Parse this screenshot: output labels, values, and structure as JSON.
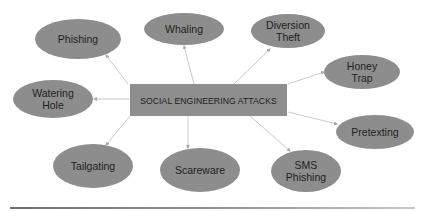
{
  "diagram": {
    "title": "SOCIAL ENGINEERING ATTACKS",
    "center": {
      "label": "SOCIAL ENGINEERING ATTACKS",
      "x": 130,
      "y": 84,
      "width": 157,
      "height": 32
    },
    "colors": {
      "node_fill": "#8d8d8d",
      "center_fill": "#8e8e8e",
      "text": "#1e1e1e",
      "connector": "#c4c4c4",
      "background": "#ffffff"
    },
    "nodes": [
      {
        "id": "phishing",
        "lines": [
          "Phishing"
        ],
        "cx": 78,
        "cy": 39,
        "rx": 43,
        "ry": 20,
        "from": [
          128,
          84
        ],
        "to": [
          106,
          55
        ]
      },
      {
        "id": "whaling",
        "lines": [
          "Whaling"
        ],
        "cx": 184,
        "cy": 29,
        "rx": 40,
        "ry": 16,
        "from": [
          194,
          84
        ],
        "to": [
          184,
          46
        ]
      },
      {
        "id": "diversion-theft",
        "lines": [
          "Diversion",
          "Theft"
        ],
        "cx": 288,
        "cy": 31,
        "rx": 37,
        "ry": 17,
        "from": [
          234,
          84
        ],
        "to": [
          270,
          49
        ]
      },
      {
        "id": "honey-trap",
        "lines": [
          "Honey",
          "Trap"
        ],
        "cx": 362,
        "cy": 72,
        "rx": 38,
        "ry": 17,
        "from": [
          288,
          84
        ],
        "to": [
          324,
          72
        ]
      },
      {
        "id": "watering-hole",
        "lines": [
          "Watering",
          "Hole"
        ],
        "cx": 53,
        "cy": 99,
        "rx": 40,
        "ry": 19,
        "from": [
          130,
          99
        ],
        "to": [
          94,
          99
        ]
      },
      {
        "id": "pretexting",
        "lines": [
          "Pretexting"
        ],
        "cx": 375,
        "cy": 132,
        "rx": 39,
        "ry": 17,
        "from": [
          288,
          112
        ],
        "to": [
          337,
          124
        ]
      },
      {
        "id": "tailgating",
        "lines": [
          "Tailgating"
        ],
        "cx": 93,
        "cy": 166,
        "rx": 40,
        "ry": 22,
        "from": [
          130,
          116
        ],
        "to": [
          106,
          145
        ]
      },
      {
        "id": "scareware",
        "lines": [
          "Scareware"
        ],
        "cx": 200,
        "cy": 170,
        "rx": 40,
        "ry": 22,
        "from": [
          188,
          116
        ],
        "to": [
          188,
          148
        ]
      },
      {
        "id": "sms-phishing",
        "lines": [
          "SMS",
          "Phishing"
        ],
        "cx": 306,
        "cy": 171,
        "rx": 35,
        "ry": 21,
        "from": [
          250,
          116
        ],
        "to": [
          290,
          151
        ]
      }
    ]
  },
  "footer": {
    "rule": "horizontal-divider"
  }
}
